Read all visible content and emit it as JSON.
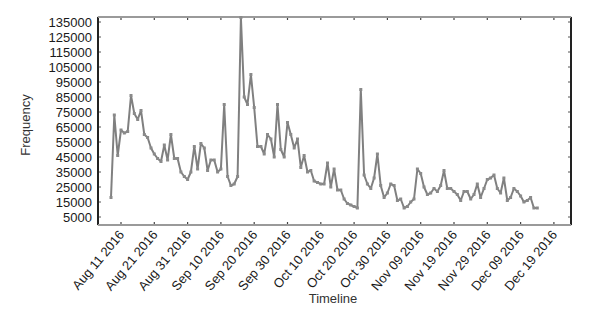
{
  "chart_data": {
    "type": "line",
    "title": "",
    "xlabel": "Timeline",
    "ylabel": "Frequency",
    "ylim": [
      0,
      138000
    ],
    "grid": false,
    "legend": null,
    "line_color": "#808080",
    "y_ticks": [
      135000,
      125000,
      115000,
      105000,
      95000,
      85000,
      75000,
      65000,
      55000,
      45000,
      35000,
      25000,
      15000,
      5000
    ],
    "x_tick_labels": [
      "Aug 11 2016",
      "Aug 21 2016",
      "Aug 31 2016",
      "Sep 10 2016",
      "Sep 20 2016",
      "Sep 30 2016",
      "Oct 10 2016",
      "Oct 20 2016",
      "Oct 30 2016",
      "Nov 09 2016",
      "Nov 19 2016",
      "Nov 29 2016",
      "Dec 09 2016",
      "Dec 19 2016"
    ],
    "x_start_offset_days": -3,
    "series": [
      {
        "name": "Frequency",
        "values": [
          18000,
          73000,
          46000,
          63000,
          61000,
          62000,
          86000,
          74000,
          70000,
          76000,
          60000,
          58000,
          51000,
          47000,
          44000,
          42000,
          53000,
          43000,
          60000,
          44000,
          44000,
          35000,
          32000,
          30000,
          35000,
          52000,
          37000,
          54000,
          51000,
          36000,
          43000,
          43000,
          35000,
          37000,
          80000,
          32000,
          26000,
          27000,
          32000,
          138000,
          85000,
          80000,
          100000,
          78000,
          52000,
          52000,
          47000,
          60000,
          57000,
          45000,
          80000,
          50000,
          45000,
          68000,
          60000,
          51000,
          57000,
          38000,
          46000,
          35000,
          36000,
          29000,
          28000,
          27000,
          27000,
          41000,
          25000,
          37000,
          23000,
          23000,
          17000,
          14000,
          13000,
          12000,
          11000,
          90000,
          33000,
          27000,
          24000,
          31000,
          47000,
          26000,
          18000,
          21000,
          27000,
          26000,
          16000,
          17000,
          11000,
          12000,
          15000,
          17000,
          37000,
          34000,
          25000,
          20000,
          21000,
          24000,
          22000,
          26000,
          36000,
          24000,
          24000,
          22000,
          20000,
          16000,
          22000,
          22000,
          17000,
          20000,
          27000,
          18000,
          24000,
          30000,
          31000,
          33000,
          24000,
          21000,
          31000,
          16000,
          18000,
          24000,
          22000,
          19000,
          15000,
          16000,
          18000,
          11000,
          11000
        ]
      }
    ]
  }
}
